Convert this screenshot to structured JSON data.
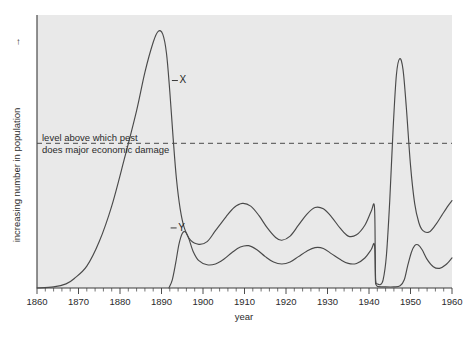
{
  "chart_data": {
    "type": "line",
    "title": "",
    "xlabel": "year",
    "ylabel": "increasing number in population",
    "ylabel_arrow": "→",
    "xlim": [
      1860,
      1960
    ],
    "ylim": [
      0,
      100
    ],
    "grid": false,
    "legend_position": "inline-labels",
    "x_ticks": [
      1860,
      1870,
      1880,
      1890,
      1900,
      1910,
      1920,
      1930,
      1940,
      1950,
      1960
    ],
    "x_tick_labels": [
      "1860",
      "1870",
      "1880",
      "1890",
      "1900",
      "1910",
      "1920",
      "1930",
      "1940",
      "1950",
      "1960"
    ],
    "x_minor_tick_step": 2,
    "y_ticks_labeled": false,
    "annotations": [
      {
        "name": "threshold-annotation",
        "line1": "level above which pest",
        "line2": "does major economic damage",
        "y_value": 53,
        "style": "dashed-horizontal-line"
      }
    ],
    "series": [
      {
        "name": "X",
        "label": "X",
        "label_x": 1892.5,
        "label_y": 76,
        "description": "pest population: explosive outbreak peaking about 1889, crash to a damped oscillating plateau, sudden collapse in 1941 followed by a large resurgence peaking about 1947 above the damage threshold",
        "points": [
          [
            1860,
            0
          ],
          [
            1864,
            0.4
          ],
          [
            1867,
            1.5
          ],
          [
            1869,
            3.5
          ],
          [
            1872,
            8
          ],
          [
            1875,
            17
          ],
          [
            1878,
            30
          ],
          [
            1881,
            47
          ],
          [
            1884,
            65
          ],
          [
            1886,
            79
          ],
          [
            1888,
            90
          ],
          [
            1889.2,
            94
          ],
          [
            1890.3,
            93
          ],
          [
            1891.2,
            86
          ],
          [
            1892,
            72
          ],
          [
            1892.8,
            55
          ],
          [
            1893.6,
            40
          ],
          [
            1894.5,
            29
          ],
          [
            1895.5,
            22
          ],
          [
            1897,
            17.5
          ],
          [
            1899,
            16
          ],
          [
            1901,
            17
          ],
          [
            1903,
            21
          ],
          [
            1905.5,
            26
          ],
          [
            1907.5,
            29.5
          ],
          [
            1909.5,
            31
          ],
          [
            1911.5,
            30
          ],
          [
            1913.5,
            26.5
          ],
          [
            1915.5,
            22
          ],
          [
            1917.5,
            18.5
          ],
          [
            1919,
            17.5
          ],
          [
            1921,
            19
          ],
          [
            1923,
            23
          ],
          [
            1925,
            27
          ],
          [
            1927,
            29.5
          ],
          [
            1929,
            29
          ],
          [
            1931,
            26
          ],
          [
            1933,
            22
          ],
          [
            1935,
            19
          ],
          [
            1937,
            19.5
          ],
          [
            1939,
            23
          ],
          [
            1940.5,
            28
          ],
          [
            1941.3,
            30
          ],
          [
            1941.5,
            14
          ],
          [
            1941.6,
            3
          ],
          [
            1942,
            1.5
          ],
          [
            1942.6,
            1.2
          ],
          [
            1943.4,
            3
          ],
          [
            1944.2,
            12
          ],
          [
            1945,
            32
          ],
          [
            1945.8,
            58
          ],
          [
            1946.6,
            78
          ],
          [
            1947.4,
            84
          ],
          [
            1948.2,
            80
          ],
          [
            1949,
            66
          ],
          [
            1950,
            45
          ],
          [
            1951,
            31
          ],
          [
            1952,
            24
          ],
          [
            1953,
            21
          ],
          [
            1954.5,
            20.5
          ],
          [
            1956,
            23
          ],
          [
            1957.5,
            26.5
          ],
          [
            1959,
            30
          ],
          [
            1960,
            32
          ]
        ]
      },
      {
        "name": "Y",
        "label": "Y",
        "label_x": 1892.2,
        "label_y": 22,
        "description": "predator/parasite population: appears about 1892 following the host outbreak, tracks the pest with a lagging lower-amplitude oscillation, collapses in 1941 and recovers from about 1949",
        "points": [
          [
            1891.8,
            0
          ],
          [
            1892.6,
            3
          ],
          [
            1893.4,
            9
          ],
          [
            1894.2,
            16
          ],
          [
            1895,
            20
          ],
          [
            1895.8,
            20.5
          ],
          [
            1896.6,
            18
          ],
          [
            1897.6,
            13.5
          ],
          [
            1899,
            10
          ],
          [
            1901,
            8.5
          ],
          [
            1903,
            8.8
          ],
          [
            1905,
            10.5
          ],
          [
            1907,
            13
          ],
          [
            1909,
            15
          ],
          [
            1911,
            15.5
          ],
          [
            1913,
            14
          ],
          [
            1915,
            11.5
          ],
          [
            1917,
            9.5
          ],
          [
            1919,
            8.8
          ],
          [
            1921,
            9.5
          ],
          [
            1923,
            11.5
          ],
          [
            1925,
            13.5
          ],
          [
            1927,
            14.8
          ],
          [
            1929,
            14.5
          ],
          [
            1931,
            12.5
          ],
          [
            1933,
            10.5
          ],
          [
            1935,
            9
          ],
          [
            1937,
            9
          ],
          [
            1939,
            11
          ],
          [
            1940.5,
            14
          ],
          [
            1941.3,
            16
          ],
          [
            1941.5,
            7
          ],
          [
            1941.6,
            1.5
          ],
          [
            1942,
            0.6
          ],
          [
            1944,
            0.4
          ],
          [
            1946,
            0.4
          ],
          [
            1947.5,
            0.8
          ],
          [
            1948.5,
            3
          ],
          [
            1949.3,
            8
          ],
          [
            1950.2,
            13
          ],
          [
            1951,
            15.5
          ],
          [
            1951.8,
            15.8
          ],
          [
            1952.8,
            14
          ],
          [
            1954,
            10.5
          ],
          [
            1955.5,
            7.8
          ],
          [
            1957,
            7.2
          ],
          [
            1958.5,
            8.5
          ],
          [
            1960,
            11
          ]
        ]
      }
    ]
  }
}
